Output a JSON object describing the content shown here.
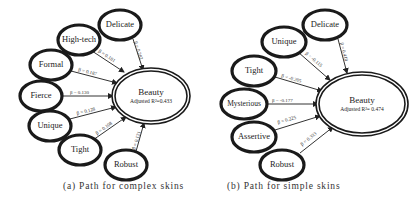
{
  "diagrams": [
    {
      "caption": "(a)  Path for complex skins",
      "outcome": {
        "label": "Beauty",
        "sub": "Adjusted R²=0.433"
      },
      "predictors": [
        {
          "label": "Delicate",
          "beta": "β = 0.282"
        },
        {
          "label": "High-tech",
          "beta": "β = 0.181"
        },
        {
          "label": "Formal",
          "beta": "β = 0.187"
        },
        {
          "label": "Fierce",
          "beta": "β = 0.130"
        },
        {
          "label": "Unique",
          "beta": "β = 0.128"
        },
        {
          "label": "Tight",
          "beta": "β = 0.108"
        },
        {
          "label": "Robust",
          "beta": "β = 0.121"
        }
      ]
    },
    {
      "caption": "(b) Path for simple skins",
      "outcome": {
        "label": "Beauty",
        "sub": "Adjusted R²= 0.474"
      },
      "predictors": [
        {
          "label": "Delicate",
          "beta": "β = 0.418"
        },
        {
          "label": "Unique",
          "beta": "β = -0.115"
        },
        {
          "label": "Tight",
          "beta": "β = -0.205"
        },
        {
          "label": "Mysterious",
          "beta": "β = -0.177"
        },
        {
          "label": "Assertive",
          "beta": "β = 0.225"
        },
        {
          "label": "Robust",
          "beta": "β = 0.333"
        }
      ]
    }
  ]
}
